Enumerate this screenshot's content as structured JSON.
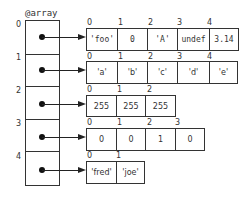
{
  "diagram": {
    "array_name": "@array",
    "main_indices": [
      "0",
      "1",
      "2",
      "3",
      "4"
    ],
    "rows": [
      {
        "indices": [
          "0",
          "1",
          "2",
          "3",
          "4"
        ],
        "values": [
          "'foo'",
          "0",
          "'A'",
          "undef",
          "3.14"
        ]
      },
      {
        "indices": [
          "0",
          "1",
          "2",
          "3",
          "4"
        ],
        "values": [
          "'a'",
          "'b'",
          "'c'",
          "'d'",
          "'e'"
        ]
      },
      {
        "indices": [
          "0",
          "1",
          "2"
        ],
        "values": [
          "255",
          "255",
          "255"
        ]
      },
      {
        "indices": [
          "0",
          "1",
          "2",
          "3"
        ],
        "values": [
          "0",
          "0",
          "1",
          "0"
        ]
      },
      {
        "indices": [
          "0",
          "1"
        ],
        "values": [
          "'fred'",
          "'joe'"
        ]
      }
    ]
  }
}
